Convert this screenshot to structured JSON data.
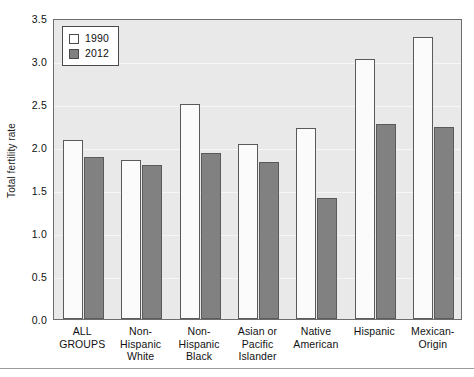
{
  "chart_data": {
    "type": "bar",
    "title": "",
    "xlabel": "",
    "ylabel": "Total fertility rate",
    "ylim": [
      0.0,
      3.5
    ],
    "ytick_step": 0.5,
    "ytick_labels": [
      "0.0",
      "0.5",
      "1.0",
      "1.5",
      "2.0",
      "2.5",
      "3.0",
      "3.5"
    ],
    "ytick_values": [
      0.0,
      0.5,
      1.0,
      1.5,
      2.0,
      2.5,
      3.0,
      3.5
    ],
    "grid": true,
    "grid_axis": "y",
    "legend_position": "top-left",
    "categories": [
      "ALL GROUPS",
      "Non-Hispanic White",
      "Non-Hispanic Black",
      "Asian or Pacific Islander",
      "Native American",
      "Hispanic",
      "Mexican-Origin"
    ],
    "category_lines": [
      [
        "ALL",
        "GROUPS"
      ],
      [
        "Non-",
        "Hispanic",
        "White"
      ],
      [
        "Non-",
        "Hispanic",
        "Black"
      ],
      [
        "Asian or",
        "Pacific",
        "Islander"
      ],
      [
        "Native",
        "American"
      ],
      [
        "Hispanic"
      ],
      [
        "Mexican-",
        "Origin"
      ]
    ],
    "series": [
      {
        "name": "1990",
        "color": "#fbfbfb",
        "edge_color": "#5a5a5a",
        "values": [
          2.08,
          1.85,
          2.5,
          2.04,
          2.22,
          3.02,
          3.28
        ]
      },
      {
        "name": "2012",
        "color": "#818181",
        "edge_color": "#5a5a5a",
        "values": [
          1.88,
          1.79,
          1.93,
          1.82,
          1.41,
          2.27,
          2.23
        ]
      }
    ]
  },
  "legend": {
    "items": [
      {
        "label": "1990",
        "swatch": "white-square"
      },
      {
        "label": "2012",
        "swatch": "gray-square"
      }
    ]
  },
  "colors": {
    "plot_background": "#e9e9e9",
    "frame": "#6d6d6d",
    "gridline": "#f6f6f6",
    "bar_1990": "#fbfbfb",
    "bar_2012": "#818181",
    "text": "#111111",
    "page_background": "#ffffff"
  }
}
